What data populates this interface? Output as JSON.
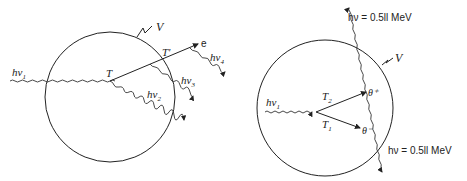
{
  "diagram": {
    "left_panel": {
      "name": "photon-interaction-sequence",
      "volume_label": "V",
      "incident_photon_label": "hν",
      "incident_photon_sub": "1",
      "interaction_point_1": "T",
      "interaction_point_2": "T'",
      "electron_label": "e",
      "scattered_photons": [
        {
          "label": "hν",
          "sub": "2"
        },
        {
          "label": "hν",
          "sub": "3"
        },
        {
          "label": "hν",
          "sub": "4"
        }
      ]
    },
    "right_panel": {
      "name": "pair-production",
      "volume_label": "V",
      "incident_photon_label": "hν",
      "incident_photon_sub": "1",
      "positron_track_label": "T",
      "positron_track_sub": "2",
      "electron_track_label": "T",
      "electron_track_sub": "1",
      "positron_label": "θ⁺",
      "electron_label": "θ⁻",
      "annihilation_photon_top": "hν = 0.5ll MeV",
      "annihilation_photon_bottom": "hν = 0.5ll MeV"
    }
  }
}
